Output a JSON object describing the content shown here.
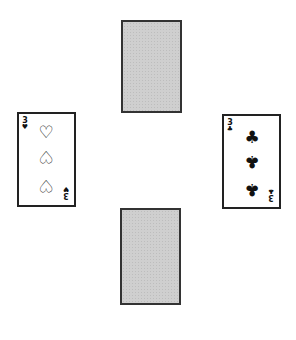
{
  "table": {
    "background": "#ffffff",
    "cards": {
      "north": {
        "face": "down",
        "back_color": "#cfcfcf"
      },
      "south": {
        "face": "down",
        "back_color": "#cfcfcf"
      },
      "west": {
        "face": "up",
        "rank": "3",
        "suit": "hearts",
        "suit_glyph": "♡",
        "index_glyph": "♥",
        "pips": [
          "♡",
          "♡",
          "♡"
        ]
      },
      "east": {
        "face": "up",
        "rank": "3",
        "suit": "clubs",
        "suit_glyph": "♣",
        "index_glyph": "♣",
        "pips": [
          "♣",
          "♣",
          "♣"
        ]
      }
    }
  }
}
